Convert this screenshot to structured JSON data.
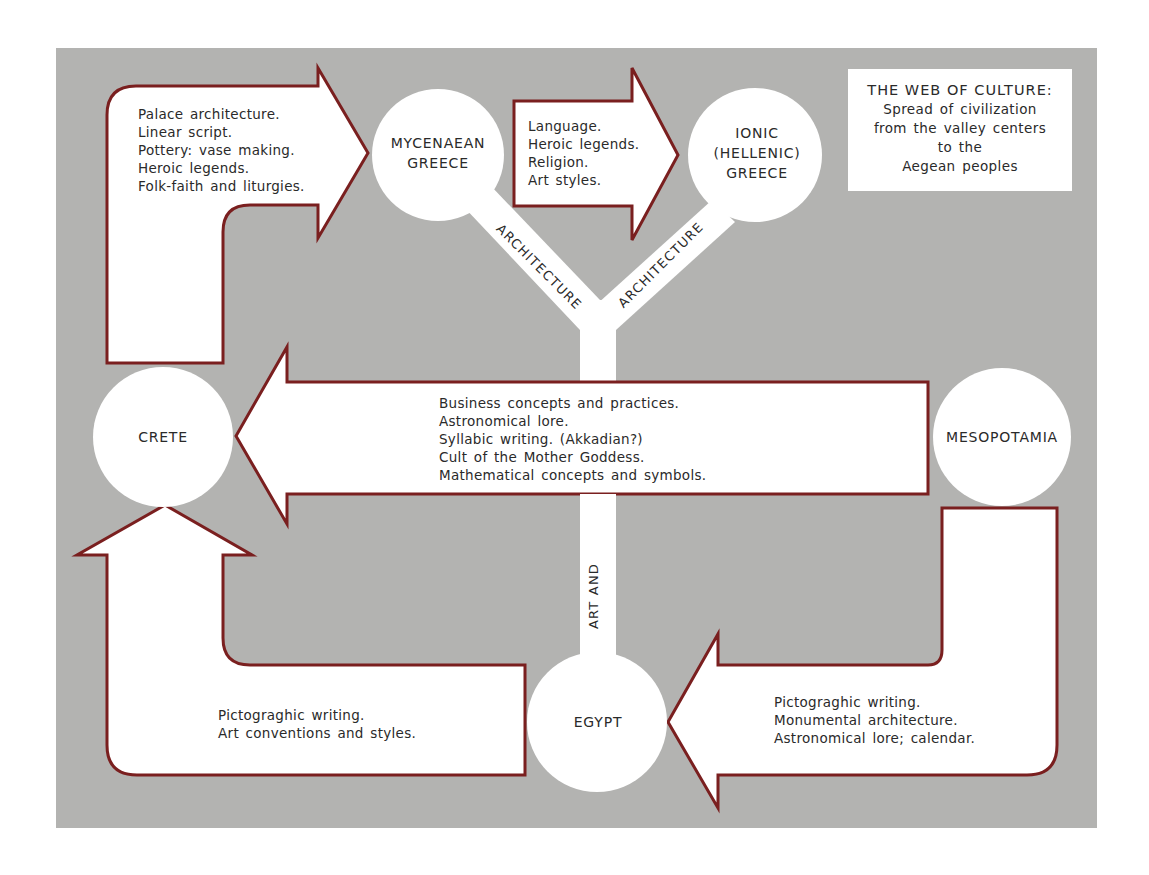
{
  "title": {
    "heading": "THE WEB OF CULTURE:",
    "lines": [
      "Spread of civilization",
      "from the valley centers",
      "to the",
      "Aegean peoples"
    ]
  },
  "colors": {
    "background_panel": "#b3b3b1",
    "arrow_fill": "#ffffff",
    "arrow_outline": "#7a1f1f",
    "node_fill": "#ffffff",
    "text": "#2a2a2a"
  },
  "nodes": {
    "mycenaean": [
      "MYCENAEAN",
      "GREECE"
    ],
    "ionic": [
      "IONIC",
      "(HELLENIC)",
      "GREECE"
    ],
    "crete": [
      "CRETE"
    ],
    "mesopotamia": [
      "MESOPOTAMIA"
    ],
    "egypt": [
      "EGYPT"
    ]
  },
  "flows": {
    "crete_to_mycenaean": [
      "Palace architecture.",
      "Linear script.",
      "Pottery: vase making.",
      "Heroic legends.",
      "Folk-faith and liturgies."
    ],
    "mycenaean_to_ionic": [
      "Language.",
      "Heroic legends.",
      "Religion.",
      "Art styles."
    ],
    "mesopotamia_to_crete": [
      "Business concepts and practices.",
      "Astronomical lore.",
      "Syllabic writing. (Akkadian?)",
      "Cult of the Mother Goddess.",
      "Mathematical concepts and symbols."
    ],
    "mesopotamia_to_egypt": [
      "Pictograghic writing.",
      "Monumental architecture.",
      "Astronomical lore; calendar."
    ],
    "egypt_to_crete": [
      "Pictograghic writing.",
      "Art conventions and styles."
    ]
  },
  "connectors": {
    "egypt_stem": "ART AND",
    "left_branch": "ARCHITECTURE",
    "right_branch": "ARCHITECTURE"
  }
}
